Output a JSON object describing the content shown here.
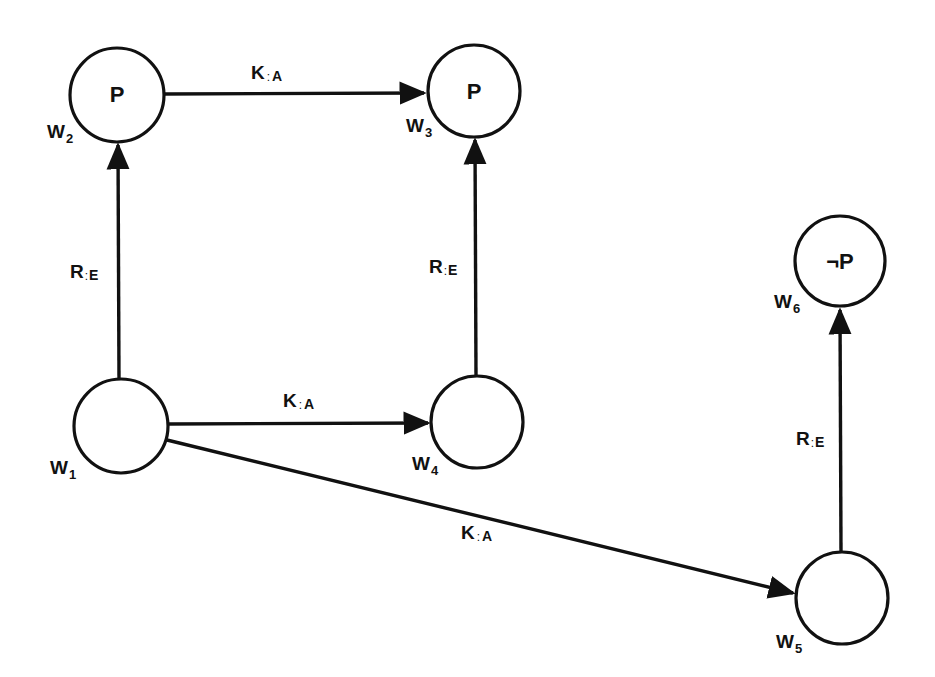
{
  "diagram": {
    "type": "kripke-model",
    "colors": {
      "stroke": "#111111",
      "background": "#ffffff"
    },
    "nodes": [
      {
        "id": "w1",
        "name": "W",
        "subscript": "1",
        "proposition": "",
        "cx": 121,
        "cy": 426,
        "r": 47
      },
      {
        "id": "w2",
        "name": "W",
        "subscript": "2",
        "proposition": "P",
        "cx": 117,
        "cy": 95,
        "r": 47
      },
      {
        "id": "w3",
        "name": "W",
        "subscript": "3",
        "proposition": "P",
        "cx": 474,
        "cy": 91,
        "r": 46
      },
      {
        "id": "w4",
        "name": "W",
        "subscript": "4",
        "proposition": "",
        "cx": 477,
        "cy": 422,
        "r": 46
      },
      {
        "id": "w5",
        "name": "W",
        "subscript": "5",
        "proposition": "",
        "cx": 842,
        "cy": 598,
        "r": 46
      },
      {
        "id": "w6",
        "name": "W",
        "subscript": "6",
        "proposition": "¬P",
        "cx": 840,
        "cy": 261,
        "r": 45
      }
    ],
    "edges": [
      {
        "id": "e1",
        "from": "w2",
        "to": "w3",
        "relation": "K",
        "separator": ":",
        "agent": "A"
      },
      {
        "id": "e2",
        "from": "w1",
        "to": "w2",
        "relation": "R",
        "separator": ":",
        "agent": "E"
      },
      {
        "id": "e3",
        "from": "w4",
        "to": "w3",
        "relation": "R",
        "separator": ":",
        "agent": "E"
      },
      {
        "id": "e4",
        "from": "w1",
        "to": "w4",
        "relation": "K",
        "separator": ":",
        "agent": "A"
      },
      {
        "id": "e5",
        "from": "w1",
        "to": "w5",
        "relation": "K",
        "separator": ":",
        "agent": "A"
      },
      {
        "id": "e6",
        "from": "w5",
        "to": "w6",
        "relation": "R",
        "separator": ":",
        "agent": "E"
      }
    ]
  }
}
